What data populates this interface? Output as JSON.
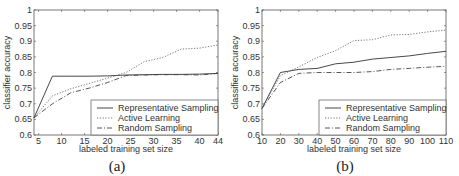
{
  "chart_data": [
    {
      "type": "line",
      "caption": "(a)",
      "title": "",
      "xlabel": "labeled training set size",
      "ylabel": "classifier accuracy",
      "xlim": [
        4,
        44
      ],
      "ylim": [
        0.6,
        1.0
      ],
      "xticks": [
        5,
        10,
        15,
        20,
        25,
        30,
        35,
        40,
        44
      ],
      "yticks": [
        0.6,
        0.65,
        0.7,
        0.75,
        0.8,
        0.85,
        0.9,
        0.95,
        1
      ],
      "grid": false,
      "legend_position": "lower right",
      "series": [
        {
          "name": "Representative Sampling",
          "style": "solid",
          "x": [
            4,
            8,
            12,
            16,
            20,
            24,
            28,
            32,
            36,
            40,
            44
          ],
          "values": [
            0.655,
            0.788,
            0.788,
            0.788,
            0.789,
            0.792,
            0.793,
            0.794,
            0.794,
            0.795,
            0.797
          ]
        },
        {
          "name": "Active Learning",
          "style": "dotted",
          "x": [
            4,
            8,
            12,
            16,
            20,
            24,
            28,
            32,
            36,
            40,
            44
          ],
          "values": [
            0.655,
            0.725,
            0.748,
            0.765,
            0.782,
            0.8,
            0.835,
            0.848,
            0.875,
            0.878,
            0.888
          ]
        },
        {
          "name": "Random Sampling",
          "style": "dashdot",
          "x": [
            4,
            8,
            12,
            16,
            20,
            24,
            28,
            32,
            36,
            40,
            44
          ],
          "values": [
            0.655,
            0.7,
            0.735,
            0.75,
            0.768,
            0.79,
            0.792,
            0.793,
            0.793,
            0.792,
            0.797
          ]
        }
      ]
    },
    {
      "type": "line",
      "caption": "(b)",
      "title": "",
      "xlabel": "labeled training set size",
      "ylabel": "classifier accuracy",
      "xlim": [
        10,
        110
      ],
      "ylim": [
        0.6,
        1.0
      ],
      "xticks": [
        10,
        20,
        30,
        40,
        50,
        60,
        70,
        80,
        90,
        100,
        110
      ],
      "yticks": [
        0.6,
        0.65,
        0.7,
        0.75,
        0.8,
        0.85,
        0.9,
        0.95,
        1
      ],
      "grid": false,
      "legend_position": "lower right",
      "series": [
        {
          "name": "Representative Sampling",
          "style": "solid",
          "x": [
            10,
            20,
            30,
            40,
            50,
            60,
            70,
            80,
            90,
            100,
            110
          ],
          "values": [
            0.685,
            0.8,
            0.81,
            0.813,
            0.828,
            0.833,
            0.843,
            0.848,
            0.853,
            0.861,
            0.868
          ]
        },
        {
          "name": "Active Learning",
          "style": "dotted",
          "x": [
            10,
            20,
            30,
            40,
            50,
            60,
            70,
            80,
            90,
            100,
            110
          ],
          "values": [
            0.685,
            0.79,
            0.818,
            0.848,
            0.87,
            0.902,
            0.905,
            0.92,
            0.922,
            0.93,
            0.936
          ]
        },
        {
          "name": "Random Sampling",
          "style": "dashdot",
          "x": [
            10,
            20,
            30,
            40,
            50,
            60,
            70,
            80,
            90,
            100,
            110
          ],
          "values": [
            0.685,
            0.768,
            0.797,
            0.8,
            0.8,
            0.8,
            0.803,
            0.81,
            0.813,
            0.817,
            0.82
          ]
        }
      ]
    }
  ],
  "captions": [
    "(a)",
    "(b)"
  ]
}
